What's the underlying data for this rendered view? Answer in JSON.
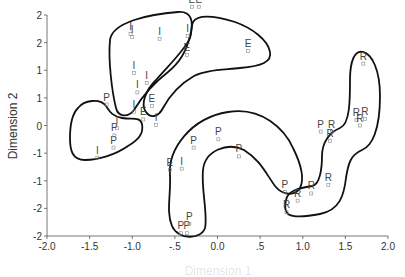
{
  "chart_data": {
    "type": "scatter",
    "title": "",
    "xlabel": "Dimension 1",
    "ylabel": "Dimension 2",
    "xlim": [
      -2.0,
      2.0
    ],
    "ylim": [
      -2.0,
      2.0
    ],
    "x_ticks": [
      "-2.0",
      "-1.5",
      "-1.0",
      "-.5",
      "0.0",
      ".5",
      "1.0",
      "1.5",
      "2.0"
    ],
    "y_ticks": [
      "2",
      "2",
      "1",
      "1",
      "0",
      "-1",
      "-1",
      "-2",
      "-2"
    ],
    "grid": false,
    "legend": null,
    "series": [
      {
        "name": "I",
        "points": [
          {
            "x": -1.02,
            "y": 1.66
          },
          {
            "x": -1.0,
            "y": 1.6
          },
          {
            "x": -0.68,
            "y": 1.57
          },
          {
            "x": -0.35,
            "y": 1.62
          },
          {
            "x": -0.98,
            "y": 0.95
          },
          {
            "x": -0.83,
            "y": 0.77
          },
          {
            "x": -0.94,
            "y": 0.6
          },
          {
            "x": -0.98,
            "y": 0.25
          },
          {
            "x": -0.72,
            "y": 0.01
          },
          {
            "x": -1.18,
            "y": -0.05
          },
          {
            "x": -1.41,
            "y": -0.58
          },
          {
            "x": -0.42,
            "y": -0.78
          }
        ]
      },
      {
        "name": "E",
        "points": [
          {
            "x": -0.3,
            "y": 2.15
          },
          {
            "x": -0.22,
            "y": 2.15
          },
          {
            "x": 0.36,
            "y": 1.35
          },
          {
            "x": -0.36,
            "y": 1.28
          },
          {
            "x": -0.77,
            "y": 0.35
          },
          {
            "x": -0.87,
            "y": 0.11
          },
          {
            "x": -0.56,
            "y": -0.8
          }
        ]
      },
      {
        "name": "P",
        "points": [
          {
            "x": -1.3,
            "y": 0.38
          },
          {
            "x": -1.22,
            "y": -0.4
          },
          {
            "x": -1.21,
            "y": -0.18
          },
          {
            "x": -0.28,
            "y": -0.4
          },
          {
            "x": 0.01,
            "y": -0.25
          },
          {
            "x": 0.25,
            "y": -0.56
          },
          {
            "x": 0.79,
            "y": -1.2
          },
          {
            "x": -0.43,
            "y": -1.95
          },
          {
            "x": -0.36,
            "y": -1.95
          },
          {
            "x": -0.33,
            "y": -1.78
          },
          {
            "x": 1.21,
            "y": -0.11
          }
        ]
      },
      {
        "name": "R",
        "points": [
          {
            "x": 1.71,
            "y": 1.12
          },
          {
            "x": 1.63,
            "y": 0.1
          },
          {
            "x": 1.73,
            "y": 0.12
          },
          {
            "x": 1.67,
            "y": 0.0
          },
          {
            "x": 1.34,
            "y": -0.12
          },
          {
            "x": 1.32,
            "y": -0.28
          },
          {
            "x": 1.3,
            "y": -1.08
          },
          {
            "x": 1.1,
            "y": -1.23
          },
          {
            "x": 0.94,
            "y": -1.36
          },
          {
            "x": 0.81,
            "y": -1.57
          }
        ]
      }
    ]
  },
  "plot": {
    "x_axis_title": "Dimension 1",
    "y_axis_title": "Dimension 2"
  }
}
